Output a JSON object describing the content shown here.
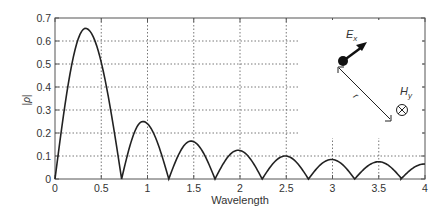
{
  "chart_data": {
    "type": "line",
    "title": "",
    "xlabel": "Wavelength",
    "ylabel": "|ρ|",
    "xlim": [
      0,
      4
    ],
    "ylim": [
      0,
      0.7
    ],
    "xticks": [
      0,
      0.5,
      1,
      1.5,
      2,
      2.5,
      3,
      3.5,
      4
    ],
    "xtick_labels": [
      "0",
      "0.5",
      "1",
      "1.5",
      "2",
      "2.5",
      "3",
      "3.5",
      "4"
    ],
    "yticks": [
      0,
      0.1,
      0.2,
      0.3,
      0.4,
      0.5,
      0.6,
      0.7
    ],
    "ytick_labels": [
      "0",
      "0.1",
      "0.2",
      "0.3",
      "0.4",
      "0.5",
      "0.6",
      "0.7"
    ],
    "grid": true,
    "legend": null,
    "series": [
      {
        "name": "|ρ| vs wavelength",
        "color": "#222222",
        "lobes": [
          {
            "start": 0.0,
            "peak_x": 0.33,
            "peak_y": 0.655,
            "end": 0.72
          },
          {
            "start": 0.72,
            "peak_x": 0.95,
            "peak_y": 0.25,
            "end": 1.23
          },
          {
            "start": 1.23,
            "peak_x": 1.47,
            "peak_y": 0.165,
            "end": 1.73
          },
          {
            "start": 1.73,
            "peak_x": 1.98,
            "peak_y": 0.125,
            "end": 2.24
          },
          {
            "start": 2.24,
            "peak_x": 2.49,
            "peak_y": 0.1,
            "end": 2.74
          },
          {
            "start": 2.74,
            "peak_x": 2.99,
            "peak_y": 0.085,
            "end": 3.24
          },
          {
            "start": 3.24,
            "peak_x": 3.5,
            "peak_y": 0.075,
            "end": 3.74
          },
          {
            "start": 3.74,
            "peak_x": 3.99,
            "peak_y": 0.065,
            "end": 4.0
          }
        ]
      }
    ],
    "annotations": {
      "e_field_label": "E",
      "e_field_sub": "x",
      "h_field_label": "H",
      "h_field_sub": "y",
      "distance_label": "r",
      "h_symbol": "⊗"
    }
  }
}
